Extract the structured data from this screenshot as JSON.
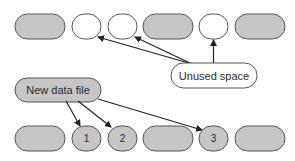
{
  "diagram": {
    "colors": {
      "used_fill": "#c6c6c6",
      "free_fill": "#ffffff",
      "stroke": "#555555",
      "arrow": "#222222",
      "text": "#2b2b2b"
    },
    "top_row": {
      "label": "Before: data file with unused space",
      "blocks": [
        {
          "id": "t1",
          "kind": "used",
          "shape": "capsule",
          "label": ""
        },
        {
          "id": "t2",
          "kind": "unused",
          "shape": "circle",
          "label": ""
        },
        {
          "id": "t3",
          "kind": "unused",
          "shape": "circle",
          "label": ""
        },
        {
          "id": "t4",
          "kind": "used",
          "shape": "capsule",
          "label": ""
        },
        {
          "id": "t5",
          "kind": "unused",
          "shape": "circle",
          "label": ""
        },
        {
          "id": "t6",
          "kind": "used",
          "shape": "capsule",
          "label": ""
        }
      ]
    },
    "callouts": {
      "unused_space": {
        "label": "Unused space",
        "points_to": [
          "t2",
          "t3",
          "t5"
        ]
      },
      "new_data_file": {
        "label": "New data file",
        "points_to": [
          "b2",
          "b3",
          "b5"
        ]
      }
    },
    "bottom_row": {
      "label": "After: new data written into unused space",
      "blocks": [
        {
          "id": "b1",
          "kind": "used",
          "shape": "capsule",
          "label": ""
        },
        {
          "id": "b2",
          "kind": "new",
          "shape": "circle",
          "label": "1"
        },
        {
          "id": "b3",
          "kind": "new",
          "shape": "circle",
          "label": "2"
        },
        {
          "id": "b4",
          "kind": "used",
          "shape": "capsule",
          "label": ""
        },
        {
          "id": "b5",
          "kind": "new",
          "shape": "circle",
          "label": "3"
        },
        {
          "id": "b6",
          "kind": "used",
          "shape": "capsule",
          "label": ""
        }
      ]
    }
  }
}
